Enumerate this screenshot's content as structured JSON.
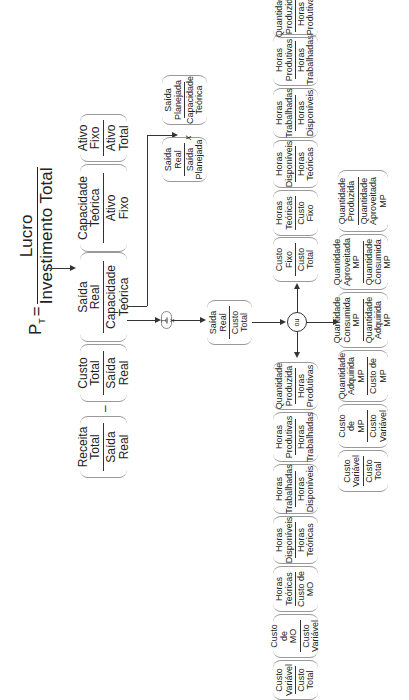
{
  "formula": {
    "lhs": "P",
    "lhs_subscript": "T",
    "equals": "=",
    "numerator": "Lucro",
    "denominator": "Investimento Total"
  },
  "level1": {
    "receita": {
      "num": "Receita\nTotal",
      "den": "Saída\nReal"
    },
    "minus": "–",
    "custo": {
      "num": "Custo\nTotal",
      "den": "Saída\nReal"
    },
    "saida_cap": {
      "num": "Saída\nReal",
      "den": "Capacidade\nTeórica"
    },
    "cap_ativo": {
      "num": "Capacidade\nTeórica",
      "den": "Ativo\nFixo"
    },
    "ativo": {
      "num": "Ativo\nFixo",
      "den": "Ativo\nTotal"
    }
  },
  "level2": {
    "saida_plan": {
      "num": "Saída\nReal",
      "den": "Saída\nPlanejada"
    },
    "times": "x",
    "plan_cap": {
      "num": "Saída\nPlanejada",
      "den": "Capacidade\nTeórica"
    }
  },
  "inverse": {
    "num": "1",
    "den": "x"
  },
  "saida_custo": {
    "num": "Saída\nReal",
    "den": "Custo\nTotal"
  },
  "or_node": "ou",
  "branch_fixed": [
    {
      "num": "Custo\nFixo",
      "den": "Custo\nTotal"
    },
    {
      "num": "Horas\nTeóricas",
      "den": "Custo\nFixo"
    },
    {
      "num": "Horas\nDisponíveis",
      "den": "Horas\nTeóricas"
    },
    {
      "num": "Horas\nTrabalhadas",
      "den": "Horas\nDisponíveis"
    },
    {
      "num": "Horas\nProdutivas",
      "den": "Horas\nTrabalhadas"
    },
    {
      "num": "Quantidade\nProduzida",
      "den": "Horas\nProdutivas"
    }
  ],
  "branch_labor": [
    {
      "num": "Quantidade\nProduzida",
      "den": "Horas\nProdutivas"
    },
    {
      "num": "Horas\nProdutivas",
      "den": "Horas\nTrabalhadas"
    },
    {
      "num": "Horas\nTrabalhadas",
      "den": "Horas\nDisponíveis"
    },
    {
      "num": "Horas\nDisponíveis",
      "den": "Horas\nTeóricas"
    },
    {
      "num": "Horas\nTeóricas",
      "den": "Custo de\nMO"
    },
    {
      "num": "Custo de\nMO",
      "den": "Custo\nVariável"
    },
    {
      "num": "Custo\nVariável",
      "den": "Custo\nTotal"
    }
  ],
  "branch_material": [
    {
      "num": "Quantidade\nProduzida",
      "den": "Quantidade\nAproveitada MP"
    },
    {
      "num": "Quantidade\nAproveitada MP",
      "den": "Quantidade\nConsumida MP"
    },
    {
      "num": "Quantidade\nConsumida MP",
      "den": "Quantidade\nAdquirida MP"
    },
    {
      "num": "Quantidade\nAdquirida MP",
      "den": "Custo de\nMP"
    },
    {
      "num": "Custo de\nMP",
      "den": "Custo\nVariável"
    },
    {
      "num": "Custo\nVariável",
      "den": "Custo\nTotal"
    }
  ]
}
